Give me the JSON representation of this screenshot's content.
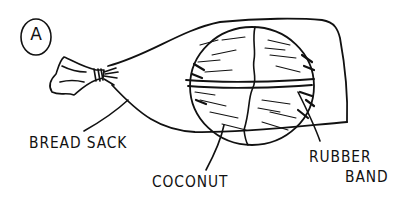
{
  "figure": {
    "letter": "A"
  },
  "labels": {
    "bread_sack": "BREAD SACK",
    "coconut": "COCONUT",
    "rubber_band_line1": "RUBBER",
    "rubber_band_line2": "BAND"
  },
  "colors": {
    "ink": "#111111",
    "background": "#ffffff"
  }
}
